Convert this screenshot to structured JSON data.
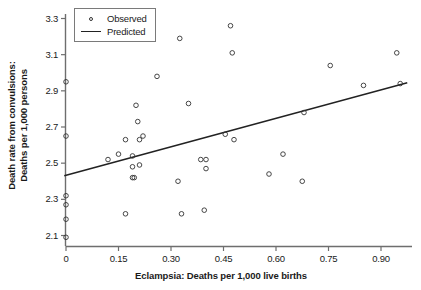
{
  "chart_data": {
    "type": "scatter",
    "title": "",
    "xlabel": "Eclampsia: Deaths per 1,000 live births",
    "ylabel_line1": "Death rate from convulsions:",
    "ylabel_line2": "Deaths per 1,000 persons",
    "xlim": [
      -0.02,
      1.0
    ],
    "ylim": [
      2.05,
      3.37
    ],
    "grid": false,
    "legend_position": "top-left",
    "xticks": [
      "0",
      "0.15",
      "0.30",
      "0.45",
      "0.60",
      "0.75",
      "0.90"
    ],
    "xtick_values": [
      0,
      0.15,
      0.3,
      0.45,
      0.6,
      0.75,
      0.9
    ],
    "yticks": [
      "2.1",
      "2.3",
      "2.5",
      "2.7",
      "2.9",
      "3.1",
      "3.3"
    ],
    "ytick_values": [
      2.1,
      2.3,
      2.5,
      2.7,
      2.9,
      3.1,
      3.3
    ],
    "series": [
      {
        "name": "Observed",
        "marker": "open-circle",
        "color": "#333333",
        "points": [
          [
            0.0,
            2.95
          ],
          [
            0.0,
            2.65
          ],
          [
            0.0,
            2.32
          ],
          [
            0.0,
            2.27
          ],
          [
            0.0,
            2.19
          ],
          [
            0.0,
            2.09
          ],
          [
            0.12,
            2.52
          ],
          [
            0.15,
            2.55
          ],
          [
            0.17,
            2.63
          ],
          [
            0.17,
            2.22
          ],
          [
            0.19,
            2.54
          ],
          [
            0.19,
            2.48
          ],
          [
            0.19,
            2.42
          ],
          [
            0.195,
            2.42
          ],
          [
            0.2,
            2.82
          ],
          [
            0.205,
            2.73
          ],
          [
            0.21,
            2.63
          ],
          [
            0.21,
            2.49
          ],
          [
            0.22,
            2.65
          ],
          [
            0.26,
            2.98
          ],
          [
            0.32,
            2.4
          ],
          [
            0.325,
            3.19
          ],
          [
            0.33,
            2.22
          ],
          [
            0.35,
            2.83
          ],
          [
            0.385,
            2.52
          ],
          [
            0.395,
            2.24
          ],
          [
            0.4,
            2.52
          ],
          [
            0.4,
            2.47
          ],
          [
            0.455,
            2.66
          ],
          [
            0.47,
            3.26
          ],
          [
            0.475,
            3.11
          ],
          [
            0.48,
            2.63
          ],
          [
            0.58,
            2.44
          ],
          [
            0.62,
            2.55
          ],
          [
            0.675,
            2.4
          ],
          [
            0.68,
            2.78
          ],
          [
            0.755,
            3.04
          ],
          [
            0.85,
            2.93
          ],
          [
            0.945,
            3.11
          ],
          [
            0.955,
            2.94
          ]
        ]
      },
      {
        "name": "Predicted",
        "marker": "line",
        "color": "#222222",
        "line_endpoints": [
          [
            -0.005,
            2.43
          ],
          [
            0.975,
            2.945
          ]
        ],
        "slope": 0.525,
        "intercept": 2.433
      }
    ]
  },
  "legend": {
    "items": [
      {
        "label": "Observed",
        "key": "open-circle-key"
      },
      {
        "label": "Predicted",
        "key": "line-key"
      }
    ]
  },
  "colors": {
    "axis": "#6e6e6e",
    "marker": "#333333",
    "line": "#222222",
    "text": "#1a1a1a",
    "background": "#ffffff"
  }
}
